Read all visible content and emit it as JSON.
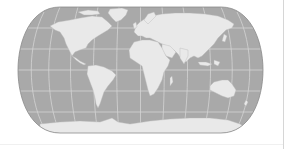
{
  "map": {
    "projection": "pseudo-cylindrical world map (rounded sides, flat poles)",
    "frame": {
      "x": 18,
      "y": 7,
      "width": 245,
      "height": 126
    },
    "colors": {
      "ocean": "#a9a9a9",
      "land": "#e9e9e9",
      "graticule": "#d4d4d4",
      "outline": "#8a8a8a",
      "background": "#ffffff"
    },
    "graticule": {
      "parallels_y": [
        28,
        49,
        70,
        91,
        112
      ],
      "meridian_count": 11
    },
    "continents": [
      "North America",
      "Greenland",
      "South America",
      "Europe",
      "Africa",
      "Asia",
      "Australia",
      "Antarctica"
    ]
  }
}
